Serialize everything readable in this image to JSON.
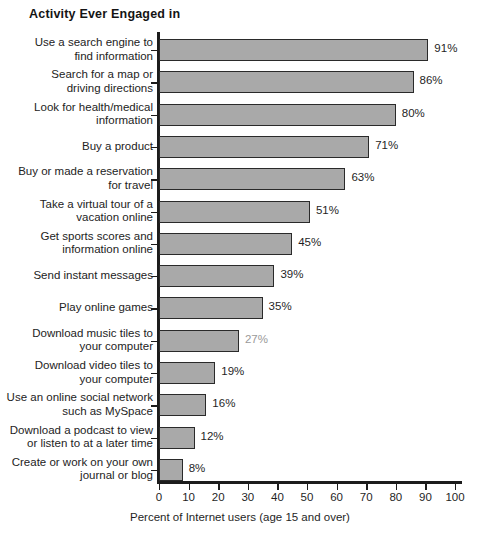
{
  "chart_data": {
    "type": "bar",
    "orientation": "horizontal",
    "title": "Activity Ever Engaged in",
    "xlabel": "Percent of Internet users (age 15 and over)",
    "ylabel": "",
    "xlim": [
      0,
      100
    ],
    "xticks": [
      0,
      10,
      20,
      30,
      40,
      50,
      60,
      70,
      80,
      90,
      100
    ],
    "grid": false,
    "legend": null,
    "bar_color": "#a9a9a9",
    "bar_border_color": "#2a2a2a",
    "categories": [
      "Use a search engine to\nfind information",
      "Search for a map or\ndriving directions",
      "Look for health/medical\ninformation",
      "Buy a product",
      "Buy or made a reservation\nfor travel",
      "Take a virtual tour of a\nvacation online",
      "Get sports scores and\ninformation online",
      "Send instant messages",
      "Play online games",
      "Download music tiles to\nyour computer",
      "Download video tiles to\nyour computer",
      "Use an online social network\nsuch as MySpace",
      "Download a podcast to view\nor listen to at a later time",
      "Create or work on your own\njournal or blog"
    ],
    "values": [
      91,
      86,
      80,
      71,
      63,
      51,
      45,
      39,
      35,
      27,
      19,
      16,
      12,
      8
    ],
    "value_labels": [
      "91%",
      "86%",
      "80%",
      "71%",
      "63%",
      "51%",
      "45%",
      "39%",
      "35%",
      "27%",
      "19%",
      "16%",
      "12%",
      "8%"
    ]
  }
}
